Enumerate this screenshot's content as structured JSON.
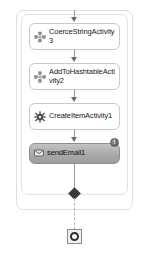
{
  "diagram": {
    "type": "workflow-designer-canvas",
    "colors": {
      "canvas_background": "#ffffff",
      "container_border": "#dcdcdc",
      "node_border": "#c8c8c8",
      "node_background": "#ffffff",
      "selected_node_fill": "#a9a9a9",
      "selected_node_border": "#8e8e8e",
      "connector_line": "#9a9a9a",
      "arrow_head": "#6f6f6f",
      "diamond_node": "#3a3a3a",
      "badge_fill": "#6d6d6d",
      "text": "#1a1a1a"
    },
    "containers": [
      {
        "name": "outer-scope",
        "label": ""
      },
      {
        "name": "inner-sequence-scope",
        "label": ""
      }
    ],
    "nodes": [
      {
        "id": "coerce-string-activity3",
        "label": "CoerceStringActivity3",
        "label_line1": "CoerceStringActiv",
        "label_line2": "ity3",
        "icon": "coerce-activity-icon",
        "selected": false,
        "has_badge": false
      },
      {
        "id": "add-to-hashtable-activity2",
        "label": "AddToHashtableActivity2",
        "label_line1": "AddToHashtable",
        "label_line2": "Activity2",
        "icon": "hashtable-activity-icon",
        "selected": false,
        "has_badge": false
      },
      {
        "id": "create-item-activity1",
        "label": "CreateItemActivity1",
        "label_line1": "CreateItemActivit",
        "label_line2": "y1",
        "icon": "gear-activity-icon",
        "selected": false,
        "has_badge": false
      },
      {
        "id": "send-email1",
        "label": "sendEmail1",
        "label_line1": "sendEmail1",
        "label_line2": "",
        "icon": "send-email-icon",
        "selected": true,
        "has_badge": true,
        "badge_symbol": "!",
        "badge_name": "error-badge"
      }
    ],
    "junction": {
      "name": "diamond-junction",
      "shape": "diamond"
    },
    "terminator": {
      "name": "workflow-terminator",
      "shape": "square-with-ring"
    },
    "connectors": [
      {
        "from": "canvas-top",
        "to": "coerce-string-activity3",
        "style": "solid-arrow"
      },
      {
        "from": "coerce-string-activity3",
        "to": "add-to-hashtable-activity2",
        "style": "solid-arrow"
      },
      {
        "from": "add-to-hashtable-activity2",
        "to": "create-item-activity1",
        "style": "solid-arrow"
      },
      {
        "from": "create-item-activity1",
        "to": "send-email1",
        "style": "solid-arrow"
      },
      {
        "from": "send-email1",
        "to": "diamond-junction",
        "style": "solid-line"
      },
      {
        "from": "diamond-junction",
        "to": "workflow-terminator",
        "style": "dashed-line"
      }
    ]
  }
}
